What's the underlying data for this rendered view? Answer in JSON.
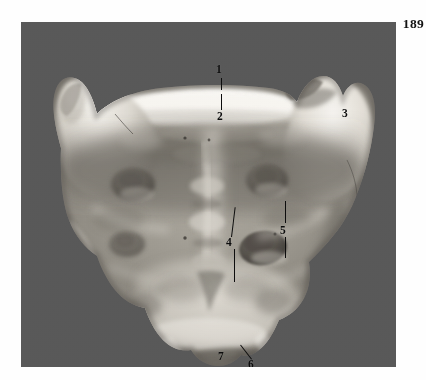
{
  "page": {
    "number": "189",
    "background_color": "#fefefe"
  },
  "plate": {
    "name": "anatomical-photograph",
    "subject": "sacrum-posterior-view",
    "background_color": "#595959",
    "bone_color_light": "#e8e6e0",
    "bone_color_mid": "#9a968d",
    "bone_color_dark": "#6b6760",
    "left": 21,
    "top": 22,
    "width": 375,
    "height": 345
  },
  "labels": [
    {
      "id": "label-1",
      "text": "1",
      "x": 195,
      "y": 42,
      "has_leader": true
    },
    {
      "id": "label-2",
      "text": "2",
      "x": 196,
      "y": 89,
      "has_leader": true
    },
    {
      "id": "label-3",
      "text": "3",
      "x": 321,
      "y": 86,
      "has_leader": false
    },
    {
      "id": "label-4",
      "text": "4",
      "x": 205,
      "y": 215,
      "has_leader": true
    },
    {
      "id": "label-5",
      "text": "5",
      "x": 259,
      "y": 203,
      "has_leader": true
    },
    {
      "id": "label-6",
      "text": "6",
      "x": 227,
      "y": 337,
      "has_leader": true
    },
    {
      "id": "label-7",
      "text": "7",
      "x": 197,
      "y": 329,
      "has_leader": false
    }
  ],
  "leaders": [
    {
      "id": "leader-1",
      "x": 200.5,
      "y": 56,
      "width": 1.2,
      "height": 12,
      "rotate": 0
    },
    {
      "id": "leader-2",
      "x": 200.5,
      "y": 72,
      "width": 1.2,
      "height": 16,
      "rotate": 0
    },
    {
      "id": "leader-4-upper",
      "x": 210,
      "y": 185,
      "width": 1.2,
      "height": 30,
      "rotate": 6
    },
    {
      "id": "leader-4-lower",
      "x": 213,
      "y": 227,
      "width": 1.2,
      "height": 33,
      "rotate": 0
    },
    {
      "id": "leader-5-upper",
      "x": 264,
      "y": 179,
      "width": 1.2,
      "height": 22,
      "rotate": 0
    },
    {
      "id": "leader-5-lower",
      "x": 264,
      "y": 215,
      "width": 1.2,
      "height": 21,
      "rotate": 0
    },
    {
      "id": "leader-6",
      "x": 219,
      "y": 325,
      "width": 1.2,
      "height": 16,
      "rotate": -38
    }
  ]
}
